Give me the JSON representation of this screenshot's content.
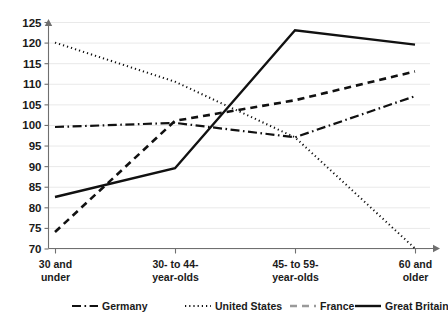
{
  "chart_data": {
    "type": "line",
    "title": "",
    "subtitle": "",
    "xlabel": "",
    "ylabel": "",
    "categories": [
      "30 and\nunder",
      "30- to 44-\nyear-olds",
      "45- to 59-\nyear-olds",
      "60 and\nolder"
    ],
    "category_lines": [
      [
        "30 and",
        "under"
      ],
      [
        "30- to 44-",
        "year-olds"
      ],
      [
        "45- to 59-",
        "year-olds"
      ],
      [
        "60 and",
        "older"
      ]
    ],
    "ylim": [
      70,
      125
    ],
    "yticks": [
      70,
      75,
      80,
      85,
      90,
      95,
      100,
      105,
      110,
      115,
      120,
      125
    ],
    "ytick_labels": [
      "70",
      "75",
      "80",
      "85",
      "90",
      "95",
      "100",
      "105",
      "110",
      "115",
      "120",
      "125"
    ],
    "grid": true,
    "legend_position": "bottom",
    "series": [
      {
        "name": "Germany",
        "style": "dash-dot",
        "color": "#111111",
        "values": [
          99.5,
          100.5,
          97.0,
          107.0
        ]
      },
      {
        "name": "United States",
        "style": "dotted",
        "color": "#111111",
        "values": [
          120.0,
          110.5,
          97.0,
          70.0
        ]
      },
      {
        "name": "France",
        "style": "dashed",
        "color": "#9a9a9a",
        "values": [
          74.0,
          101.0,
          106.0,
          113.0
        ]
      },
      {
        "name": "Great Britain",
        "style": "solid",
        "color": "#111111",
        "values": [
          82.5,
          89.5,
          123.0,
          119.5
        ]
      }
    ]
  },
  "legend": {
    "entries": [
      {
        "label": "Germany",
        "style": "dash-dot"
      },
      {
        "label": "United States",
        "style": "dotted"
      },
      {
        "label": "France",
        "style": "dashed"
      },
      {
        "label": "Great Britain",
        "style": "solid"
      }
    ]
  },
  "colors": {
    "grid": "#e9e9e9",
    "axis": "#6f6f6f",
    "text": "#1a1a1a",
    "dark_series": "#111111",
    "gray_series": "#9a9a9a",
    "background": "#ffffff"
  }
}
